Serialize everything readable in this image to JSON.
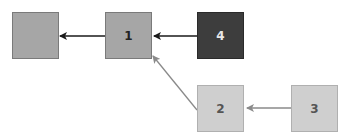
{
  "diagram": {
    "type": "node-link graph",
    "nodes": [
      {
        "id": "n0",
        "label": "",
        "shade": "medium",
        "fill": "#a6a6a6"
      },
      {
        "id": "n1",
        "label": "1",
        "shade": "medium",
        "fill": "#a6a6a6"
      },
      {
        "id": "n4",
        "label": "4",
        "shade": "dark",
        "fill": "#3d3d3d"
      },
      {
        "id": "n2",
        "label": "2",
        "shade": "light",
        "fill": "#cfcfcf"
      },
      {
        "id": "n3",
        "label": "3",
        "shade": "light",
        "fill": "#cfcfcf"
      }
    ],
    "edges": [
      {
        "from": "1",
        "to": "(unlabeled)",
        "color": "#1a1a1a"
      },
      {
        "from": "4",
        "to": "1",
        "color": "#1a1a1a"
      },
      {
        "from": "2",
        "to": "1",
        "color": "#8a8a8a"
      },
      {
        "from": "3",
        "to": "2",
        "color": "#8a8a8a"
      }
    ]
  }
}
